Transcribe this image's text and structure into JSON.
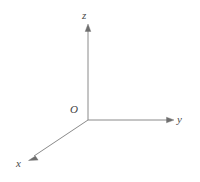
{
  "figure": {
    "name": "three-dimensional-cartesian-coordinate-axes",
    "type": "line-diagram",
    "background_color": "#ffffff",
    "line_color": "#8a8a8a",
    "label_color": "#4a4a4a",
    "line_width": 1,
    "width": 200,
    "height": 182
  },
  "origin": {
    "label": "O",
    "x": 88,
    "y": 120
  },
  "axes": [
    {
      "id": "z-axis",
      "label": "z",
      "direction": "up",
      "from_x": 88,
      "from_y": 120,
      "to_x": 88,
      "to_y": 26,
      "arrowhead": true
    },
    {
      "id": "y-axis",
      "label": "y",
      "direction": "right",
      "from_x": 88,
      "from_y": 120,
      "to_x": 172,
      "to_y": 120,
      "arrowhead": true
    },
    {
      "id": "x-axis",
      "label": "x",
      "direction": "down-left",
      "from_x": 88,
      "from_y": 120,
      "to_x": 30,
      "to_y": 159,
      "arrowhead": true
    }
  ],
  "geometry": {
    "z_axis_path": "M 88 120 L 88 30",
    "y_axis_path": "M 88 120 L 168 120",
    "x_axis_path": "M 88 120 L 34 156",
    "z_arrow_points": "88,24 85.2,31.5 90.8,31.5",
    "y_arrow_points": "174,120 166.5,117.2 166.5,122.8",
    "x_arrow_points": "28.5,160.5 35.4,156.1 38.1,160.1"
  }
}
